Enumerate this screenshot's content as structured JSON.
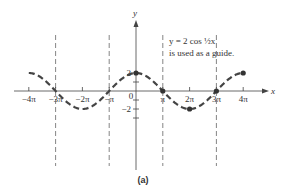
{
  "chart_data": {
    "type": "line",
    "title": "",
    "caption": "(a)",
    "xlabel": "x",
    "ylabel": "y",
    "annotation": {
      "line1": "y = 2 cos ½x",
      "line2": "is used as a guide."
    },
    "x_ticks": [
      "-4π",
      "-3π",
      "-2π",
      "-π",
      "0",
      "π",
      "2π",
      "3π",
      "4π"
    ],
    "x_tick_values": [
      -4,
      -3,
      -2,
      -1,
      0,
      1,
      2,
      3,
      4
    ],
    "y_ticks": [
      "2",
      "-2"
    ],
    "y_tick_values": [
      2,
      -2
    ],
    "xlim_pi": [
      -4,
      4
    ],
    "ylim": [
      -2,
      2
    ],
    "series": [
      {
        "name": "y = 2 cos (x/2)",
        "style": "dashed",
        "function": "2*cos(x/2)",
        "x_pi": [
          -4,
          -3,
          -2,
          -1,
          0,
          1,
          2,
          3,
          4
        ],
        "values": [
          2,
          0,
          -2,
          0,
          2,
          0,
          -2,
          0,
          2
        ]
      }
    ],
    "marked_points": [
      {
        "x": "0",
        "y": 2
      },
      {
        "x": "π",
        "y": 0
      },
      {
        "x": "2π",
        "y": -2
      },
      {
        "x": "3π",
        "y": 0
      },
      {
        "x": "4π",
        "y": 2
      }
    ],
    "vertical_asymptotes": [
      "-3π",
      "-π",
      "π",
      "3π"
    ],
    "grid": false,
    "legend": "none"
  }
}
